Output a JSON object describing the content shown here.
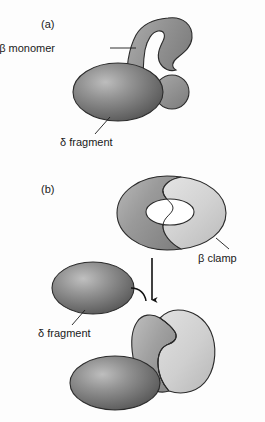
{
  "figure": {
    "background_color": "#fdfdfd",
    "panels": [
      {
        "id": "a",
        "tag": "(a)",
        "caption_labels": [
          {
            "name": "beta-monomer",
            "text": "β monomer"
          },
          {
            "name": "delta-fragment",
            "text": "δ fragment"
          }
        ]
      },
      {
        "id": "b",
        "tag": "(b)",
        "caption_labels": [
          {
            "name": "beta-clamp",
            "text": "β clamp"
          },
          {
            "name": "delta-fragment",
            "text": "δ fragment"
          }
        ]
      }
    ]
  },
  "labels": {
    "panel_a_tag": "(a)",
    "panel_b_tag": "(b)",
    "beta_monomer": "β monomer",
    "delta_fragment_a": "δ fragment",
    "beta_clamp": "β clamp",
    "delta_fragment_b": "δ fragment"
  },
  "colors": {
    "background": "#fdfdfd",
    "delta_fragment_dark": "#6e6e6e",
    "delta_fragment_highlight": "#b4b4b4",
    "beta_dark_half": "#8d8d8d",
    "beta_light_half": "#c9c9c9",
    "beta_light_highlight": "#dcdcdc",
    "outline": "#2b2b2b",
    "text": "#1a1a1a",
    "hole_fill": "#ffffff",
    "arrow": "#111111"
  },
  "shapes": {
    "panel_a": [
      {
        "name": "beta-monomer-body",
        "type": "kidney",
        "fill": "beta_dark_half"
      },
      {
        "name": "beta-monomer-lobe",
        "type": "circle",
        "fill": "beta_dark_half"
      },
      {
        "name": "delta-fragment-ellipse",
        "type": "ellipse",
        "fill": "delta_fragment_dark"
      }
    ],
    "panel_b": [
      {
        "name": "beta-clamp-ring",
        "type": "torus",
        "fill_left": "beta_dark_half",
        "fill_right": "beta_light_half"
      },
      {
        "name": "beta-clamp-hole",
        "type": "ellipse",
        "fill": "hole_fill"
      },
      {
        "name": "delta-fragment-ellipse-free",
        "type": "ellipse",
        "fill": "delta_fragment_dark"
      },
      {
        "name": "assembly-arrow",
        "type": "arrow",
        "direction": "down"
      },
      {
        "name": "beta-clamp-open",
        "type": "c-shape",
        "fill_left": "beta_dark_half",
        "fill_right": "beta_light_half"
      },
      {
        "name": "delta-fragment-ellipse-bound",
        "type": "ellipse",
        "fill": "delta_fragment_dark"
      }
    ]
  }
}
